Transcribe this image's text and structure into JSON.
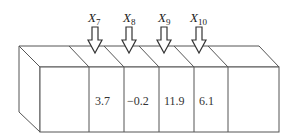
{
  "diagram": {
    "line_color": "#555555",
    "cells": [
      {
        "label": "",
        "value": ""
      },
      {
        "label": "X",
        "index": "7",
        "value": "3.7"
      },
      {
        "label": "X",
        "index": "8",
        "value": "−0.2"
      },
      {
        "label": "X",
        "index": "9",
        "value": "11.9"
      },
      {
        "label": "X",
        "index": "10",
        "value": "6.1"
      },
      {
        "label": "",
        "value": ""
      }
    ]
  }
}
